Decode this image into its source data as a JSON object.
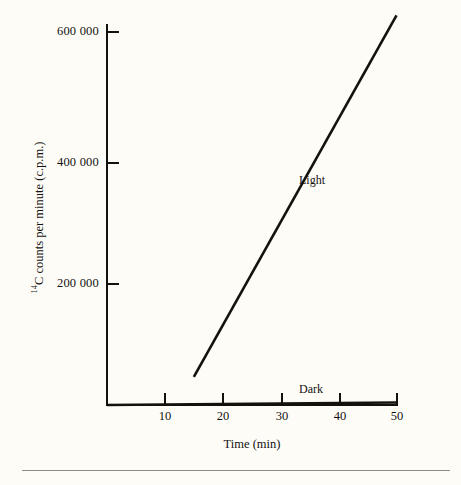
{
  "chart_data": {
    "type": "line",
    "title": "",
    "xlabel": "Time (min)",
    "ylabel": "14C counts per minute (c.p.m.)",
    "ylabel_prefix_sup": "14",
    "ylabel_rest": "C  counts per minute (c.p.m.)",
    "xlim": [
      0,
      50
    ],
    "ylim": [
      0,
      620000
    ],
    "grid": false,
    "legend": "inline-labels",
    "xticks": [
      {
        "value": 10,
        "label": "10"
      },
      {
        "value": 20,
        "label": "20"
      },
      {
        "value": 30,
        "label": "30"
      },
      {
        "value": 40,
        "label": "40"
      },
      {
        "value": 50,
        "label": "50"
      }
    ],
    "yticks": [
      {
        "value": 200000,
        "label": "200 000"
      },
      {
        "value": 400000,
        "label": "400 000"
      },
      {
        "value": 600000,
        "label": "600 000"
      }
    ],
    "series": [
      {
        "name": "Light",
        "x": [
          15,
          50
        ],
        "values": [
          45000,
          625000
        ],
        "color": "#15120e"
      },
      {
        "name": "Dark",
        "x": [
          0,
          50
        ],
        "values": [
          0,
          4000
        ],
        "color": "#15120e"
      }
    ]
  },
  "annotations": {
    "light_label": "Light",
    "dark_label": "Dark"
  }
}
